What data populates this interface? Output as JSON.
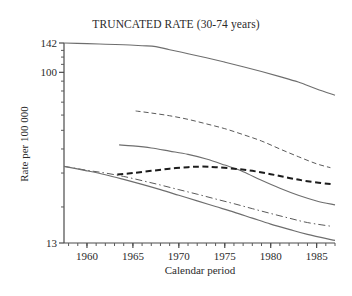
{
  "chart_data": {
    "type": "line",
    "title": "TRUNCATED RATE (30-74 years)",
    "xlabel": "Calendar period",
    "ylabel": "Rate per 100 000",
    "yscale": "log",
    "ylim": [
      13,
      142
    ],
    "xlim": [
      1957.5,
      1987
    ],
    "grid": false,
    "legend": "none",
    "ytick_labels": [
      "142",
      "100",
      "13"
    ],
    "ytick_values": [
      142,
      100,
      13
    ],
    "xtick_labels": [
      "1960",
      "1965",
      "1970",
      "1975",
      "1980",
      "1985"
    ],
    "xtick_values": [
      1960,
      1965,
      1970,
      1975,
      1980,
      1985
    ],
    "xtick_minor_step": 1,
    "series": [
      {
        "name": "series-1-top-solid",
        "style": "solid",
        "width": 1.1,
        "color": "#6e6e6e",
        "x": [
          1957.5,
          1960,
          1962,
          1964,
          1966,
          1967.5,
          1969,
          1971,
          1973,
          1975,
          1977,
          1979,
          1981,
          1983,
          1985,
          1987
        ],
        "y": [
          142.0,
          141.0,
          140.0,
          139.0,
          137.5,
          136.0,
          131.0,
          125.0,
          119.0,
          113.0,
          107.0,
          101.0,
          95.0,
          89.0,
          82.0,
          76.0
        ]
      },
      {
        "name": "series-2-fine-dashed",
        "style": "dashed-fine",
        "width": 1.0,
        "color": "#5a5a5a",
        "x": [
          1965.3,
          1967,
          1969,
          1971,
          1973,
          1975,
          1977,
          1979,
          1981,
          1983,
          1985,
          1986.5
        ],
        "y": [
          63.0,
          61.5,
          59.5,
          57.0,
          54.0,
          51.0,
          47.5,
          44.0,
          40.0,
          36.5,
          33.5,
          32.0
        ]
      },
      {
        "name": "series-3-mid-solid",
        "style": "solid",
        "width": 1.1,
        "color": "#6e6e6e",
        "x": [
          1963.5,
          1965,
          1967,
          1969,
          1971,
          1973,
          1975,
          1977,
          1979,
          1981,
          1983,
          1985,
          1987
        ],
        "y": [
          42.0,
          41.5,
          40.5,
          39.0,
          37.5,
          35.5,
          33.0,
          30.5,
          27.5,
          25.0,
          23.0,
          21.5,
          20.5
        ]
      },
      {
        "name": "series-4-bold-dashed",
        "style": "dashed-bold",
        "width": 2.0,
        "color": "#1c1c1c",
        "x": [
          1963.3,
          1965,
          1967,
          1969,
          1971,
          1972.5,
          1974,
          1976,
          1978,
          1980,
          1982,
          1984,
          1986.8
        ],
        "y": [
          29.5,
          30.0,
          30.8,
          31.6,
          32.2,
          32.4,
          32.2,
          31.6,
          30.8,
          29.6,
          28.3,
          27.2,
          26.2
        ]
      },
      {
        "name": "series-5-dash-dot",
        "style": "dash-dot",
        "width": 1.0,
        "color": "#5a5a5a",
        "x": [
          1957.5,
          1960,
          1962,
          1964,
          1966,
          1968,
          1970,
          1972,
          1974,
          1976,
          1978,
          1980,
          1982,
          1984,
          1986.5
        ],
        "y": [
          32.5,
          31.0,
          30.0,
          28.8,
          27.4,
          26.0,
          24.6,
          23.3,
          22.0,
          20.8,
          19.6,
          18.5,
          17.5,
          16.6,
          15.9
        ]
      },
      {
        "name": "series-6-bottom-solid",
        "style": "solid",
        "width": 1.2,
        "color": "#6e6e6e",
        "x": [
          1957.5,
          1960,
          1962,
          1964,
          1966,
          1968,
          1970,
          1972,
          1974,
          1976,
          1978,
          1980,
          1982,
          1984,
          1987
        ],
        "y": [
          32.5,
          30.8,
          29.4,
          27.8,
          26.2,
          24.6,
          23.0,
          21.5,
          20.1,
          18.8,
          17.5,
          16.3,
          15.3,
          14.4,
          13.4
        ]
      }
    ]
  },
  "axes": {
    "title": "TRUNCATED RATE (30-74 years)",
    "x_axis_label": "Calendar period",
    "y_axis_label": "Rate per 100 000"
  }
}
